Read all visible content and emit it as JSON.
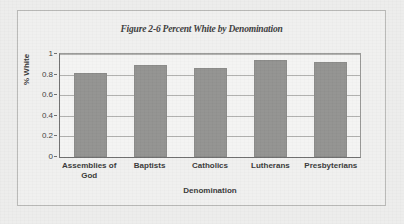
{
  "figure": {
    "background_color": "#ededec",
    "frame_color": "#b9b9b7"
  },
  "chart_data": {
    "type": "bar",
    "title": "Figure 2-6 Percent White by Denomination",
    "xlabel": "Denomination",
    "ylabel": "% White",
    "categories": [
      "Assemblies of God",
      "Baptists",
      "Catholics",
      "Lutherans",
      "Presbyterians"
    ],
    "values": [
      0.82,
      0.89,
      0.86,
      0.94,
      0.92
    ],
    "ylim": [
      0,
      1
    ],
    "yticks": [
      0,
      0.2,
      0.4,
      0.6,
      0.8,
      1
    ],
    "ytick_labels": [
      "0",
      "0.2",
      "0.4",
      "0.6",
      "0.8",
      "1"
    ],
    "grid": true,
    "grid_axis": "y",
    "legend": false,
    "bar_color": "#939391",
    "series": [
      {
        "name": "% White",
        "values": [
          0.82,
          0.89,
          0.86,
          0.94,
          0.92
        ]
      }
    ]
  }
}
